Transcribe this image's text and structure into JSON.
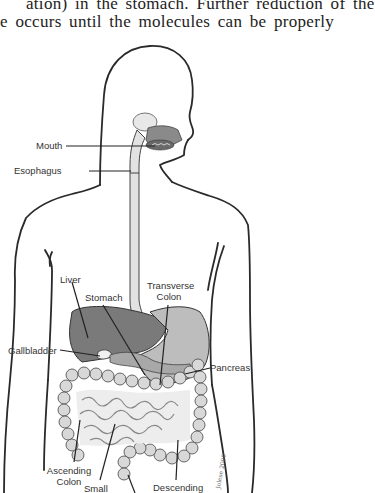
{
  "body_text": {
    "line1": "ation) in the stomach. Further reduction of the",
    "line2": "e occurs until the molecules can be properly"
  },
  "figure": {
    "labels": {
      "mouth": "Mouth",
      "esophagus": "Esophagus",
      "liver": "Liver",
      "stomach": "Stomach",
      "transverse_colon_1": "Transverse",
      "transverse_colon_2": "Colon",
      "gallbladder": "Gallbladder",
      "pancreas": "Pancreas",
      "ascending_colon_1": "Ascending",
      "ascending_colon_2": "Colon",
      "small": "Small",
      "descending": "Descending"
    },
    "signature": "Jolese 2000",
    "colors": {
      "outline": "#2a2a2a",
      "organ_dark": "#6b6b6b",
      "organ_mid": "#9a9a9a",
      "organ_light": "#d4d4d4"
    }
  }
}
